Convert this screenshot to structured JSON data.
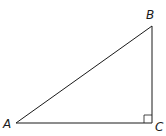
{
  "diagram": {
    "type": "right-triangle",
    "vertices": {
      "A": {
        "label": "A",
        "x": 16,
        "y": 123
      },
      "B": {
        "label": "B",
        "x": 152,
        "y": 26
      },
      "C": {
        "label": "C",
        "x": 152,
        "y": 123
      }
    },
    "right_angle_at": "C",
    "stroke_color": "#1a1a1a",
    "background": "#ffffff"
  }
}
